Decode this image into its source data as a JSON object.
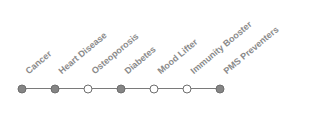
{
  "timeline": {
    "items": [
      {
        "label": "Cancer",
        "state": "filled"
      },
      {
        "label": "Heart Disease",
        "state": "filled"
      },
      {
        "label": "Osteoporosis",
        "state": "empty"
      },
      {
        "label": "Diabetes",
        "state": "filled"
      },
      {
        "label": "Mood Lifter",
        "state": "empty"
      },
      {
        "label": "Immunity Booster",
        "state": "empty"
      },
      {
        "label": "PMS Preventers",
        "state": "filled"
      }
    ]
  },
  "colors": {
    "filled": "#858585",
    "empty": "#ffffff",
    "line": "#7a7a7a",
    "label": "#8a8a8a"
  }
}
